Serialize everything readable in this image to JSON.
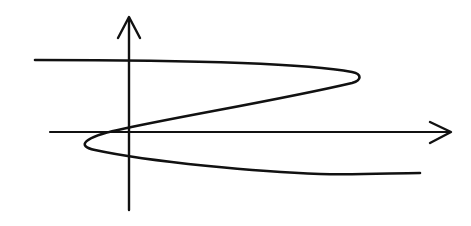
{
  "diagram": {
    "type": "hand-drawn s-curve graph on axes",
    "colors": {
      "background": "#ffffff",
      "ink": "#111111"
    },
    "axes": {
      "y_axis": {
        "x": 129,
        "y_top": 17,
        "y_bottom": 210,
        "arrow": "up"
      },
      "x_axis": {
        "y": 132,
        "x_left": 50,
        "x_right": 451,
        "arrow": "right"
      }
    },
    "curve": {
      "description": "S-shaped curve that folds back on itself (x as cubic function of y)",
      "path": "M 35 60 C 150 60, 300 62, 352 72 C 362 74, 362 80, 352 83 C 280 100, 170 118, 118 130 C 85 137, 75 146, 95 150 C 150 162, 260 172, 320 174 C 360 175, 395 173, 420 173",
      "key_points": [
        {
          "label": "start",
          "x": 35,
          "y": 60
        },
        {
          "label": "right-turning-point",
          "x": 358,
          "y": 77
        },
        {
          "label": "crosses-y-axis-upper",
          "x": 129,
          "y": 127
        },
        {
          "label": "left-turning-point",
          "x": 81,
          "y": 142
        },
        {
          "label": "crosses-y-axis-lower",
          "x": 129,
          "y": 155
        },
        {
          "label": "end",
          "x": 420,
          "y": 173
        }
      ]
    }
  }
}
